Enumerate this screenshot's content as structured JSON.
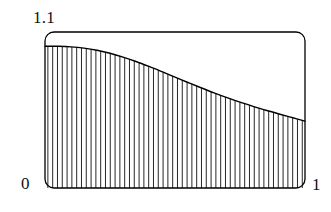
{
  "figure": {
    "background_color": "#ffffff",
    "line_color": "#000000",
    "hatch_color": "#000000",
    "frame": {
      "x_left_px": 45,
      "x_right_px": 305,
      "y_top_px": 32,
      "y_bottom_px": 188,
      "corner_radius_px": 9,
      "stroke_width_px": 1.3
    }
  },
  "labels": {
    "y_max": "1.1",
    "x_min": "0",
    "x_max": "1"
  },
  "chart_data": {
    "type": "area",
    "title": "",
    "xlabel": "",
    "ylabel": "",
    "xlim": [
      0,
      1
    ],
    "ylim": [
      0,
      1.1
    ],
    "grid": false,
    "legend": null,
    "fill_style": "vertical-hatch",
    "hatch_spacing_px": 4.8,
    "hatch_line_width_px": 0.85,
    "tick_labels": {
      "x": [
        "0",
        "1"
      ],
      "y": [
        "1.1"
      ]
    },
    "series": [
      {
        "name": "curve",
        "x": [
          0.0,
          0.05,
          0.1,
          0.15,
          0.2,
          0.25,
          0.3,
          0.35,
          0.4,
          0.45,
          0.5,
          0.55,
          0.6,
          0.65,
          0.7,
          0.75,
          0.8,
          0.85,
          0.9,
          0.95,
          1.0
        ],
        "y": [
          1.0,
          0.999,
          0.995,
          0.986,
          0.971,
          0.95,
          0.923,
          0.892,
          0.857,
          0.82,
          0.782,
          0.744,
          0.707,
          0.671,
          0.637,
          0.605,
          0.576,
          0.548,
          0.522,
          0.497,
          0.472
        ]
      }
    ]
  }
}
